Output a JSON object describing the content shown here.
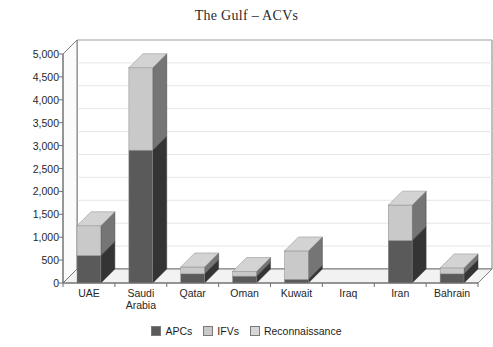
{
  "chart_data": {
    "type": "bar",
    "subtype": "stacked-column-3d",
    "title": "The Gulf – ACVs",
    "xlabel": "",
    "ylabel": "",
    "ylim": [
      0,
      5000
    ],
    "ytick_step": 500,
    "grid": true,
    "legend_position": "bottom",
    "categories": [
      "UAE",
      "Saudi\nArabia",
      "Qatar",
      "Oman",
      "Kuwait",
      "Iraq",
      "Iran",
      "Bahrain"
    ],
    "category_labels_flat": [
      "UAE",
      "Saudi Arabia",
      "Qatar",
      "Oman",
      "Kuwait",
      "Iraq",
      "Iran",
      "Bahrain"
    ],
    "ytick_labels": [
      "5,000",
      "4,500",
      "4,000",
      "3,500",
      "3,000",
      "2,500",
      "2,000",
      "1,500",
      "1,000",
      "500",
      "0"
    ],
    "ytick_values": [
      5000,
      4500,
      4000,
      3500,
      3000,
      2500,
      2000,
      1500,
      1000,
      500,
      0
    ],
    "series": [
      {
        "name": "APCs",
        "color": "#5a5a5a",
        "values": [
          600,
          2900,
          200,
          150,
          80,
          0,
          930,
          200
        ]
      },
      {
        "name": "IFVs",
        "color": "#c9c9c9",
        "values": [
          650,
          1800,
          150,
          100,
          620,
          0,
          770,
          130
        ]
      },
      {
        "name": "Reconnaissance",
        "color": "#d6d6d6",
        "values": [
          0,
          0,
          0,
          0,
          0,
          0,
          0,
          0
        ]
      }
    ],
    "totals": [
      1250,
      4700,
      350,
      250,
      700,
      0,
      1700,
      330
    ]
  },
  "legend": {
    "items": [
      {
        "label": "APCs",
        "color": "#5a5a5a"
      },
      {
        "label": "IFVs",
        "color": "#c9c9c9"
      },
      {
        "label": "Reconnaissance",
        "color": "#d6d6d6"
      }
    ]
  },
  "colors": {
    "apcs": "#5a5a5a",
    "ifvs": "#c9c9c9",
    "reconnaissance": "#d6d6d6",
    "axis": "#6f6f6f",
    "grid": "#e3e3e3",
    "floor": "#f2f2f2",
    "text": "#262626",
    "title": "#2b2b2b",
    "background": "#ffffff"
  }
}
